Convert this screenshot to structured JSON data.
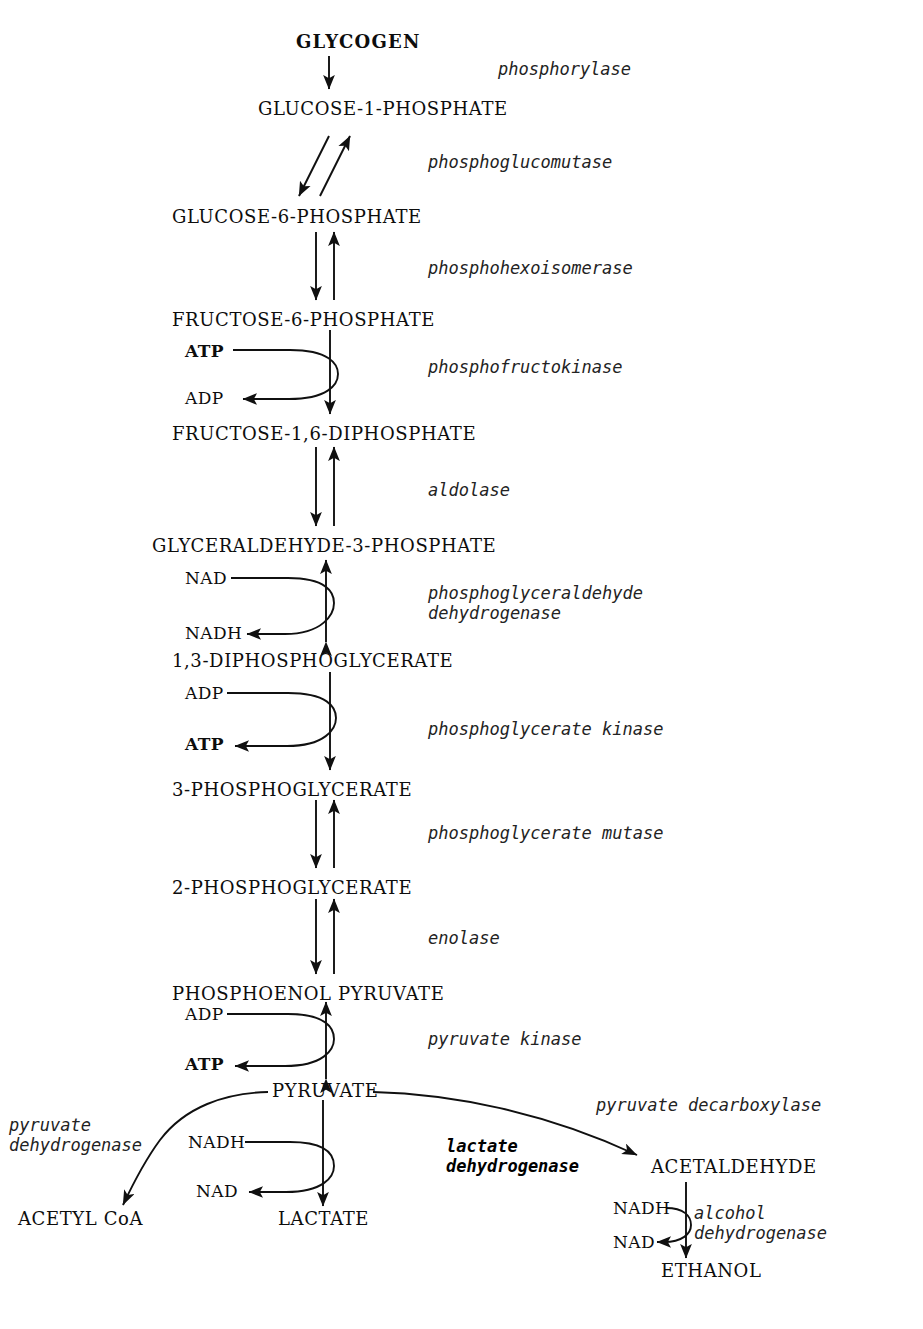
{
  "diagram": {
    "ink_color": "#0d0d0d",
    "background_color": "#ffffff"
  },
  "metabolites": [
    {
      "id": "glycogen",
      "label": "GLYCOGEN",
      "x": 296,
      "y": 33,
      "bold": true
    },
    {
      "id": "g1p",
      "label": "GLUCOSE-1-PHOSPHATE",
      "x": 258,
      "y": 100,
      "bold": false
    },
    {
      "id": "g6p",
      "label": "GLUCOSE-6-PHOSPHATE",
      "x": 172,
      "y": 208,
      "bold": false
    },
    {
      "id": "f6p",
      "label": "FRUCTOSE-6-PHOSPHATE",
      "x": 172,
      "y": 311,
      "bold": false
    },
    {
      "id": "fdp",
      "label": "FRUCTOSE-1,6-DIPHOSPHATE",
      "x": 172,
      "y": 425,
      "bold": false
    },
    {
      "id": "g3p",
      "label": "GLYCERALDEHYDE-3-PHOSPHATE",
      "x": 152,
      "y": 537,
      "bold": false
    },
    {
      "id": "dpg",
      "label": "1,3-DIPHOSPHOGLYCERATE",
      "x": 172,
      "y": 652,
      "bold": false
    },
    {
      "id": "pg3",
      "label": "3-PHOSPHOGLYCERATE",
      "x": 172,
      "y": 781,
      "bold": false
    },
    {
      "id": "pg2",
      "label": "2-PHOSPHOGLYCERATE",
      "x": 172,
      "y": 879,
      "bold": false
    },
    {
      "id": "pep",
      "label": "PHOSPHOENOL PYRUVATE",
      "x": 172,
      "y": 985,
      "bold": false
    },
    {
      "id": "pyruvate",
      "label": "PYRUVATE",
      "x": 272,
      "y": 1090,
      "bold": false
    },
    {
      "id": "acetyl_coa",
      "label": "ACETYL CoA",
      "x": 18,
      "y": 1218,
      "bold": false
    },
    {
      "id": "lactate",
      "label": "LACTATE",
      "x": 278,
      "y": 1218,
      "bold": false
    },
    {
      "id": "acetaldehyde",
      "label": "ACETALDEHYDE",
      "x": 651,
      "y": 1166,
      "bold": false
    },
    {
      "id": "ethanol",
      "label": "ETHANOL",
      "x": 661,
      "y": 1270,
      "bold": false
    }
  ],
  "cofactors": [
    {
      "id": "atp_pfk",
      "label": "ATP",
      "x": 185,
      "y": 355,
      "bold": true
    },
    {
      "id": "adp_pfk",
      "label": "ADP",
      "x": 185,
      "y": 396,
      "bold": false
    },
    {
      "id": "nad_gapdh",
      "label": "NAD",
      "x": 185,
      "y": 582,
      "bold": false
    },
    {
      "id": "nadh_gapdh",
      "label": "NADH",
      "x": 185,
      "y": 633,
      "bold": false
    },
    {
      "id": "adp_pgk",
      "label": "ADP",
      "x": 185,
      "y": 698,
      "bold": false
    },
    {
      "id": "atp_pgk",
      "label": "ATP",
      "x": 185,
      "y": 745,
      "bold": true
    },
    {
      "id": "adp_pk",
      "label": "ADP",
      "x": 185,
      "y": 1019,
      "bold": false
    },
    {
      "id": "atp_pk",
      "label": "ATP",
      "x": 185,
      "y": 1062,
      "bold": true
    },
    {
      "id": "nadh_ldh",
      "label": "NADH",
      "x": 188,
      "y": 1146,
      "bold": false
    },
    {
      "id": "nad_ldh",
      "label": "NAD",
      "x": 196,
      "y": 1188,
      "bold": false
    },
    {
      "id": "nadh_adh",
      "label": "NADH",
      "x": 617,
      "y": 1212,
      "bold": false
    },
    {
      "id": "nad_adh",
      "label": "NAD",
      "x": 617,
      "y": 1243,
      "bold": false
    }
  ],
  "enzymes": [
    {
      "id": "phosphorylase",
      "label": "phosphorylase",
      "x": 498,
      "y": 59,
      "bold": false
    },
    {
      "id": "phosphoglucomutase",
      "label": "phosphoglucomutase",
      "x": 428,
      "y": 152,
      "bold": false
    },
    {
      "id": "phosphohexoisomerase",
      "label": "phosphohexoisomerase",
      "x": 428,
      "y": 258,
      "bold": false
    },
    {
      "id": "phosphofructokinase",
      "label": "phosphofructokinase",
      "x": 428,
      "y": 357,
      "bold": false
    },
    {
      "id": "aldolase",
      "label": "aldolase",
      "x": 428,
      "y": 480,
      "bold": false
    },
    {
      "id": "gapdh",
      "label": "phosphoglyceraldehyde\ndehydrogenase",
      "x": 428,
      "y": 585,
      "bold": false
    },
    {
      "id": "phosphoglycerate_kinase",
      "label": "phosphoglycerate kinase",
      "x": 428,
      "y": 719,
      "bold": false
    },
    {
      "id": "phosphoglycerate_mutase",
      "label": "phosphoglycerate mutase",
      "x": 428,
      "y": 823,
      "bold": false
    },
    {
      "id": "enolase",
      "label": "enolase",
      "x": 428,
      "y": 928,
      "bold": false
    },
    {
      "id": "pyruvate_kinase",
      "label": "pyruvate kinase",
      "x": 428,
      "y": 1029,
      "bold": false
    },
    {
      "id": "pyruvate_dehydrogenase",
      "label": "pyruvate\ndehydrogenase",
      "x": 9,
      "y": 1117,
      "bold": false
    },
    {
      "id": "lactate_dehydrogenase",
      "label": "lactate\ndehydrogenase",
      "x": 446,
      "y": 1136,
      "bold": true
    },
    {
      "id": "pyruvate_decarboxylase",
      "label": "pyruvate decarboxylase",
      "x": 596,
      "y": 1095,
      "bold": false
    },
    {
      "id": "alcohol_dehydrogenase",
      "label": "alcohol\ndehydrogenase",
      "x": 694,
      "y": 1207,
      "bold": false
    }
  ],
  "steps": [
    {
      "from": "glycogen",
      "to": "g1p",
      "enzyme": "phosphorylase",
      "reversible": false
    },
    {
      "from": "g1p",
      "to": "g6p",
      "enzyme": "phosphoglucomutase",
      "reversible": true
    },
    {
      "from": "g6p",
      "to": "f6p",
      "enzyme": "phosphohexoisomerase",
      "reversible": true
    },
    {
      "from": "f6p",
      "to": "fdp",
      "enzyme": "phosphofructokinase",
      "reversible": false,
      "consumes": "ATP",
      "produces": "ADP"
    },
    {
      "from": "fdp",
      "to": "g3p",
      "enzyme": "aldolase",
      "reversible": true
    },
    {
      "from": "g3p",
      "to": "dpg",
      "enzyme": "phosphoglyceraldehyde dehydrogenase",
      "reversible": true,
      "consumes": "NAD",
      "produces": "NADH"
    },
    {
      "from": "dpg",
      "to": "pg3",
      "enzyme": "phosphoglycerate kinase",
      "reversible": false,
      "consumes": "ADP",
      "produces": "ATP"
    },
    {
      "from": "pg3",
      "to": "pg2",
      "enzyme": "phosphoglycerate mutase",
      "reversible": true
    },
    {
      "from": "pg2",
      "to": "pep",
      "enzyme": "enolase",
      "reversible": true
    },
    {
      "from": "pep",
      "to": "pyruvate",
      "enzyme": "pyruvate kinase",
      "reversible": true,
      "consumes": "ADP",
      "produces": "ATP"
    },
    {
      "from": "pyruvate",
      "to": "acetyl_coa",
      "enzyme": "pyruvate dehydrogenase",
      "reversible": false
    },
    {
      "from": "pyruvate",
      "to": "lactate",
      "enzyme": "lactate dehydrogenase",
      "reversible": false,
      "consumes": "NADH",
      "produces": "NAD"
    },
    {
      "from": "pyruvate",
      "to": "acetaldehyde",
      "enzyme": "pyruvate decarboxylase",
      "reversible": false
    },
    {
      "from": "acetaldehyde",
      "to": "ethanol",
      "enzyme": "alcohol dehydrogenase",
      "reversible": false,
      "consumes": "NADH",
      "produces": "NAD"
    }
  ]
}
